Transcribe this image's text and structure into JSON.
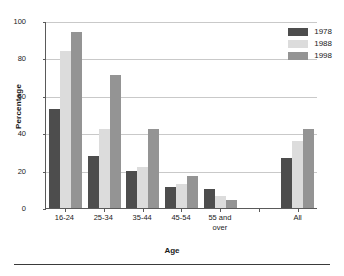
{
  "chart_data": {
    "type": "bar",
    "title": "",
    "xlabel": "Age",
    "ylabel": "Percentage",
    "categories": [
      "16-24",
      "25-34",
      "35-44",
      "45-54",
      "55 and over",
      "",
      "All"
    ],
    "series": [
      {
        "name": "1978",
        "color": "#4d4d4d",
        "values": [
          53,
          28,
          20,
          11,
          10,
          null,
          27
        ]
      },
      {
        "name": "1988",
        "color": "#dcdcdc",
        "values": [
          84,
          42,
          22,
          13,
          6.5,
          null,
          36
        ]
      },
      {
        "name": "1998",
        "color": "#949494",
        "values": [
          94,
          71,
          42,
          17,
          4.5,
          null,
          42
        ]
      }
    ],
    "ylim": [
      0,
      100
    ],
    "yticks": [
      0,
      20,
      40,
      60,
      80,
      100
    ],
    "grid": true,
    "legend_position": "top-right"
  },
  "legend": {
    "entries": [
      {
        "label": "1978",
        "color": "#4d4d4d"
      },
      {
        "label": "1988",
        "color": "#dcdcdc"
      },
      {
        "label": "1998",
        "color": "#949494"
      }
    ]
  },
  "axes": {
    "y_title": "Percentage",
    "x_title": "Age",
    "y_tick_labels": [
      "100",
      "80",
      "60",
      "40",
      "20",
      "0"
    ],
    "x_tick_labels": [
      "16-24",
      "25-34",
      "35-44",
      "45-54",
      "55 and\nover",
      "",
      "All"
    ]
  },
  "colors": {
    "axis": "#5a5a5a",
    "grid": "#c9c9c9",
    "rule": "#3a3a3a",
    "text": "#1a1a1a",
    "background": "#ffffff"
  }
}
